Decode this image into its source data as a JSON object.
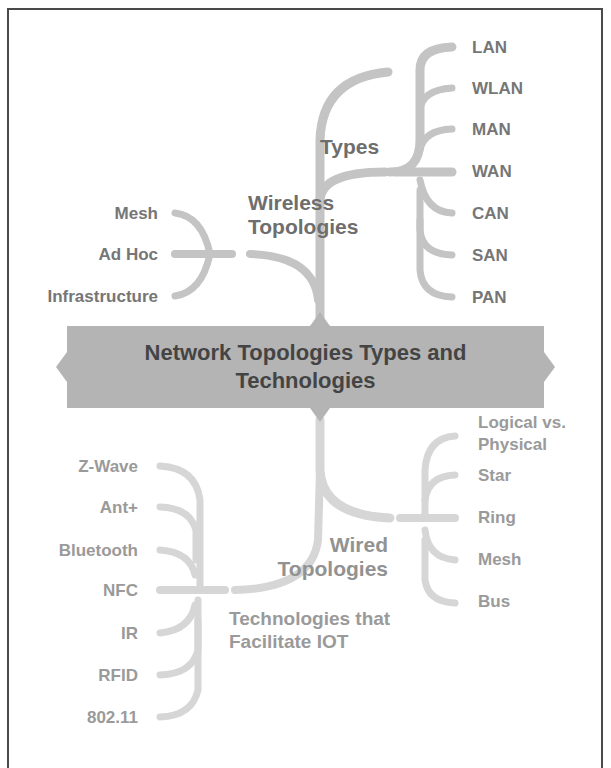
{
  "diagram": {
    "type": "mind-map",
    "central_topic": {
      "line1": "Network Topologies Types and",
      "line2": "Technologies"
    },
    "branches": {
      "wireless": {
        "label_line1": "Wireless",
        "label_line2": "Topologies",
        "children": [
          "Mesh",
          "Ad Hoc",
          "Infrastructure"
        ]
      },
      "types": {
        "label": "Types",
        "children": [
          "LAN",
          "WLAN",
          "MAN",
          "WAN",
          "CAN",
          "SAN",
          "PAN"
        ]
      },
      "wired": {
        "label_line1": "Wired",
        "label_line2": "Topologies",
        "children": [
          {
            "line1": "Logical vs.",
            "line2": "Physical"
          },
          "Star",
          "Ring",
          "Mesh",
          "Bus"
        ]
      },
      "iot": {
        "label_line1": "Technologies that",
        "label_line2": "Facilitate IOT",
        "children": [
          "Z-Wave",
          "Ant+",
          "Bluetooth",
          "NFC",
          "IR",
          "RFID",
          "802.11"
        ]
      }
    },
    "colors": {
      "center_fill": "#b4b4b4",
      "center_text": "#444444",
      "branch_dark": "#c2c2c2",
      "branch_light": "#dadada",
      "label_text": "#767676",
      "frame": "#4a4a4a"
    }
  }
}
